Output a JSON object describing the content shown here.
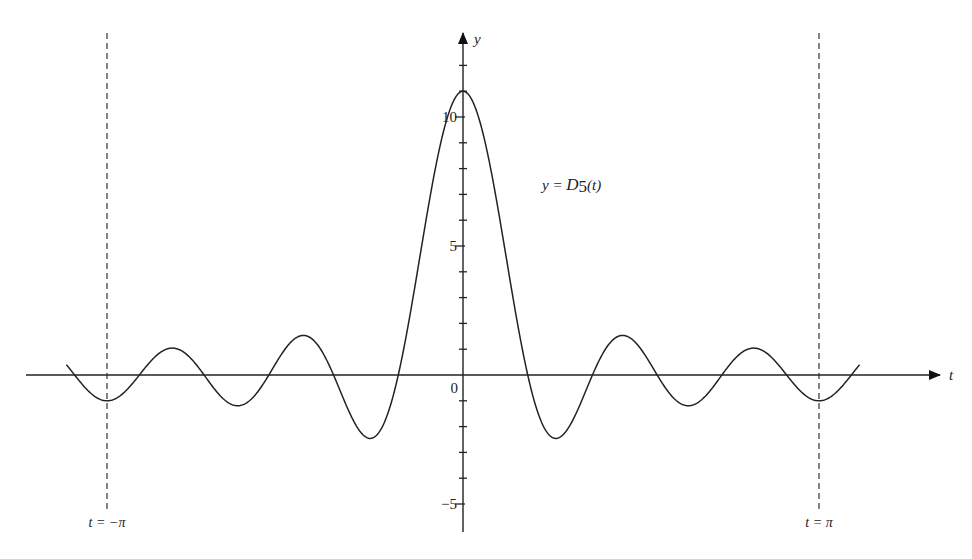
{
  "chart_data": {
    "type": "line",
    "title": "",
    "function": "D5(t) = sin(5.5 t) / sin(t/2)",
    "xlabel": "t",
    "ylabel": "y",
    "curve_label": {
      "prefix": "y = ",
      "name": "D",
      "sub": "5",
      "suffix": "(t)"
    },
    "x_range_plotted": [
      -3.5,
      3.5
    ],
    "ylim": [
      -6,
      13
    ],
    "y_ticks": [
      -5,
      -4,
      -3,
      -2,
      -1,
      0,
      1,
      2,
      3,
      4,
      5,
      6,
      7,
      8,
      9,
      10,
      11,
      12
    ],
    "y_tick_labels": [
      {
        "value": 10,
        "label": "10"
      },
      {
        "value": 5,
        "label": "5"
      },
      {
        "value": 0,
        "label": "0"
      },
      {
        "value": -5,
        "label": "−5"
      }
    ],
    "vertical_markers": [
      {
        "t": -3.14159,
        "label": "t = −π",
        "style": "dashed"
      },
      {
        "t": 3.14159,
        "label": "t = π",
        "style": "dashed"
      }
    ],
    "key_points": [
      {
        "t": 0,
        "y": 11,
        "note": "peak"
      },
      {
        "t": -0.571,
        "y": 0,
        "note": "zero"
      },
      {
        "t": 0.571,
        "y": 0,
        "note": "zero"
      },
      {
        "t": -0.8,
        "y": -2.44,
        "note": "local min"
      },
      {
        "t": 0.8,
        "y": -2.44,
        "note": "local min"
      },
      {
        "t": -1.4,
        "y": 1.55,
        "note": "local max"
      },
      {
        "t": 1.4,
        "y": 1.55,
        "note": "local max"
      },
      {
        "t": -1.96,
        "y": -1.15,
        "note": "local min"
      },
      {
        "t": 1.96,
        "y": -1.15,
        "note": "local min"
      },
      {
        "t": -2.53,
        "y": 1.05,
        "note": "local max"
      },
      {
        "t": 2.53,
        "y": 1.05,
        "note": "local max"
      },
      {
        "t": -3.14159,
        "y": -1,
        "note": "value at -pi"
      },
      {
        "t": 3.14159,
        "y": -1,
        "note": "value at pi"
      }
    ],
    "grid": false,
    "legend": "none"
  }
}
